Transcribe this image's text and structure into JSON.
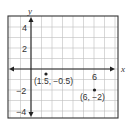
{
  "diagram": {
    "type": "coordinate-plane",
    "axes": {
      "x_label": "x",
      "y_label": "y"
    },
    "x_range": [
      -2,
      8
    ],
    "y_range": [
      -5,
      5
    ],
    "grid_step": 1,
    "tick_labels": {
      "y": [
        {
          "value": 4,
          "text": "4"
        },
        {
          "value": 2,
          "text": "2"
        },
        {
          "value": -2,
          "text": "−2"
        },
        {
          "value": -4,
          "text": "−4"
        }
      ],
      "x": [
        {
          "value": 6,
          "text": "6"
        }
      ]
    },
    "points": [
      {
        "x": 1.5,
        "y": -0.5,
        "label": "(1.5, −0.5)"
      },
      {
        "x": 6,
        "y": -2,
        "label": "(6, −2)"
      }
    ],
    "colors": {
      "grid": "#bdbdbd",
      "axis": "#222222",
      "frame": "#333333",
      "point": "#222222"
    }
  }
}
